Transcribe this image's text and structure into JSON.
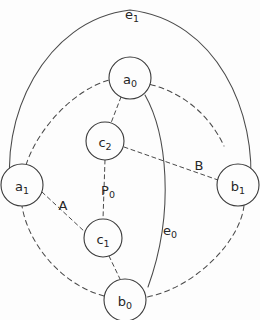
{
  "diagram": {
    "background_color": "#fdfdfd",
    "stroke_color": "#4a4a4a",
    "text_color": "#262626",
    "width": 260,
    "height": 320,
    "nodes": [
      {
        "id": "a0",
        "base": "a",
        "subscript": "0",
        "cx": 130,
        "cy": 78,
        "r": 21
      },
      {
        "id": "a1",
        "base": "a",
        "subscript": "1",
        "cx": 22,
        "cy": 185,
        "r": 21
      },
      {
        "id": "b1",
        "base": "b",
        "subscript": "1",
        "cx": 238,
        "cy": 185,
        "r": 21
      },
      {
        "id": "b0",
        "base": "b",
        "subscript": "0",
        "cx": 125,
        "cy": 300,
        "r": 21
      },
      {
        "id": "c2",
        "base": "c",
        "subscript": "2",
        "cx": 105,
        "cy": 141,
        "r": 19
      },
      {
        "id": "c1",
        "base": "c",
        "subscript": "1",
        "cx": 103,
        "cy": 238,
        "r": 19
      }
    ],
    "edges": [
      {
        "id": "outer-cycle-a0-b1",
        "style": "dashed",
        "from": "a0",
        "to": "b1"
      },
      {
        "id": "outer-cycle-b1-b0",
        "style": "dashed",
        "from": "b1",
        "to": "b0"
      },
      {
        "id": "outer-cycle-b0-a1",
        "style": "dashed",
        "from": "b0",
        "to": "a1"
      },
      {
        "id": "outer-cycle-a1-a0",
        "style": "dashed",
        "from": "a1",
        "to": "a0"
      },
      {
        "id": "e1",
        "style": "solid",
        "from": "a1",
        "to": "b1"
      },
      {
        "id": "e0",
        "style": "solid",
        "from": "a0",
        "to": "b0"
      },
      {
        "id": "a0-c2",
        "style": "dashed",
        "from": "a0",
        "to": "c2"
      },
      {
        "id": "c2-c1",
        "style": "dashed",
        "from": "c2",
        "to": "c1"
      },
      {
        "id": "c1-b0",
        "style": "dashed",
        "from": "c1",
        "to": "b0"
      },
      {
        "id": "a1-c1",
        "style": "dashed",
        "from": "a1",
        "to": "c1"
      },
      {
        "id": "c2-b1",
        "style": "dashed",
        "from": "c2",
        "to": "b1"
      }
    ],
    "edge_labels": [
      {
        "id": "e1",
        "base": "e",
        "subscript": "1",
        "x": 132,
        "y": 14
      },
      {
        "id": "e0",
        "base": "e",
        "subscript": "0",
        "x": 170,
        "y": 230
      },
      {
        "id": "A",
        "base": "A",
        "subscript": "",
        "x": 63,
        "y": 205
      },
      {
        "id": "B",
        "base": "B",
        "subscript": "",
        "x": 199,
        "y": 165
      },
      {
        "id": "P0",
        "base": "P",
        "subscript": "0",
        "x": 108,
        "y": 190
      }
    ]
  }
}
